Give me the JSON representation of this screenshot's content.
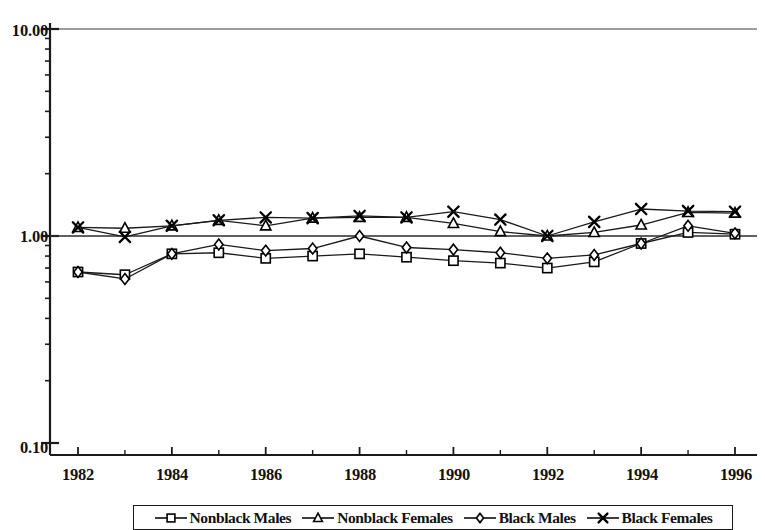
{
  "chart_data": {
    "type": "line",
    "title": "",
    "subtitle": "",
    "xlabel": "",
    "ylabel": "",
    "yscale": "log",
    "ylim": [
      0.1,
      10.0
    ],
    "xlim": [
      1982,
      1996
    ],
    "grid": false,
    "reference_line": 1.0,
    "legend_position": "bottom",
    "x": [
      1982,
      1983,
      1984,
      1985,
      1986,
      1987,
      1988,
      1989,
      1990,
      1991,
      1992,
      1993,
      1994,
      1995,
      1996
    ],
    "ytick_labels": [
      "10.00",
      "1.00",
      "0.10"
    ],
    "ytick_values": [
      10.0,
      1.0,
      0.1
    ],
    "xtick_labels": [
      "1982",
      "1984",
      "1986",
      "1988",
      "1990",
      "1992",
      "1994",
      "1996"
    ],
    "xtick_values": [
      1982,
      1984,
      1986,
      1988,
      1990,
      1992,
      1994,
      1996
    ],
    "series": [
      {
        "name": "Nonblack Males",
        "marker": "square",
        "values": [
          0.67,
          0.65,
          0.82,
          0.83,
          0.78,
          0.8,
          0.82,
          0.79,
          0.76,
          0.74,
          0.7,
          0.75,
          0.92,
          1.04,
          1.02
        ]
      },
      {
        "name": "Nonblack Females",
        "marker": "triangle",
        "values": [
          1.1,
          1.09,
          1.12,
          1.19,
          1.12,
          1.22,
          1.23,
          1.23,
          1.15,
          1.05,
          1.0,
          1.04,
          1.13,
          1.3,
          1.29
        ]
      },
      {
        "name": "Black Males",
        "marker": "diamond",
        "values": [
          0.67,
          0.62,
          0.82,
          0.91,
          0.85,
          0.87,
          1.0,
          0.88,
          0.86,
          0.83,
          0.78,
          0.81,
          0.92,
          1.12,
          1.03
        ]
      },
      {
        "name": "Black Females",
        "marker": "cross",
        "values": [
          1.1,
          0.99,
          1.12,
          1.19,
          1.23,
          1.22,
          1.25,
          1.23,
          1.31,
          1.2,
          1.0,
          1.17,
          1.35,
          1.32,
          1.31
        ]
      }
    ]
  },
  "legend": {
    "entries": [
      {
        "label": "Nonblack Males",
        "marker": "square"
      },
      {
        "label": "Nonblack Females",
        "marker": "triangle"
      },
      {
        "label": "Black Males",
        "marker": "diamond"
      },
      {
        "label": "Black Females",
        "marker": "cross"
      }
    ]
  }
}
